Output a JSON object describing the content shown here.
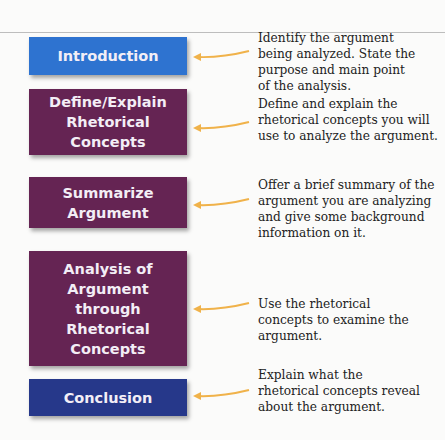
{
  "diagram": {
    "title": "",
    "colors": {
      "intro": "#2e73d0",
      "purple": "#652453",
      "conclusion": "#26388a",
      "arrow": "#f0b24a"
    },
    "steps": [
      {
        "label": "Introduction",
        "description": "Identify the argument being analyzed. State the purpose and main point of the analysis."
      },
      {
        "label": "Define/Explain Rhetorical Concepts",
        "description": "Define and explain the rhetorical concepts you will use to analyze the argument."
      },
      {
        "label": "Summarize Argument",
        "description": "Offer a brief summary of the argument you are analyzing and give some background information on it."
      },
      {
        "label": "Analysis of Argument through Rhetorical Concepts",
        "description": "Use the rhetorical concepts to examine the argument."
      },
      {
        "label": "Conclusion",
        "description": "Explain what the rhetorical concepts reveal about the argument."
      }
    ]
  }
}
